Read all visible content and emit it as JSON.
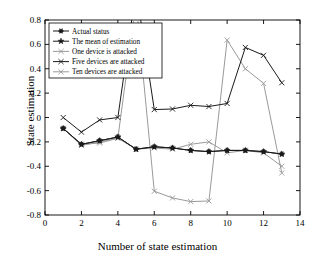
{
  "chart_data": {
    "type": "line",
    "title": "",
    "xlabel": "Number of state estimation",
    "ylabel": "State estimation",
    "xlim": [
      0,
      14
    ],
    "ylim": [
      -0.8,
      0.8
    ],
    "xticks": [
      0,
      2,
      4,
      6,
      8,
      10,
      12,
      14
    ],
    "yticks": [
      -0.8,
      -0.6,
      -0.4,
      -0.2,
      0,
      0.2,
      0.4,
      0.6,
      0.8
    ],
    "xticklabels": [
      "0",
      "2",
      "4",
      "6",
      "8",
      "10",
      "12",
      "14"
    ],
    "yticklabels": [
      "-0.8",
      "-0.6",
      "-0.4",
      "-0.2",
      "0",
      "0.2",
      "0.4",
      "0.6",
      "0.8"
    ],
    "grid": false,
    "legend_position": "upper left",
    "x": [
      1,
      2,
      3,
      4,
      5,
      6,
      7,
      8,
      9,
      10,
      11,
      12,
      13
    ],
    "series": [
      {
        "name": "Actual status",
        "marker": "circle-filled",
        "color": "#1a1a1a",
        "values": [
          -0.09,
          -0.22,
          -0.19,
          -0.16,
          -0.26,
          -0.24,
          -0.25,
          -0.27,
          -0.28,
          -0.27,
          -0.27,
          -0.28,
          -0.3
        ]
      },
      {
        "name": "The mean of estimation",
        "marker": "star",
        "color": "#1a1a1a",
        "values": [
          -0.09,
          -0.22,
          -0.19,
          -0.16,
          -0.26,
          -0.24,
          -0.25,
          -0.27,
          -0.28,
          -0.27,
          -0.27,
          -0.28,
          -0.3
        ]
      },
      {
        "name": "One device is attacked",
        "marker": "x",
        "color": "#9a9a9a",
        "values": [
          -0.09,
          -0.23,
          -0.2,
          -0.17,
          -0.26,
          -0.25,
          -0.26,
          -0.22,
          -0.2,
          -0.29,
          -0.27,
          -0.29,
          -0.4
        ]
      },
      {
        "name": "Five devices are attacked",
        "marker": "x",
        "color": "#1a1a1a",
        "values": [
          0.0,
          -0.12,
          -0.02,
          0.0,
          1.05,
          0.065,
          0.07,
          0.1,
          0.09,
          0.115,
          0.575,
          0.51,
          0.285
        ]
      },
      {
        "name": "Ten devices are attacked",
        "marker": "x",
        "color": "#9a9a9a",
        "values": [
          -0.09,
          -0.22,
          -0.21,
          -0.17,
          0.95,
          -0.605,
          -0.66,
          -0.69,
          -0.685,
          0.635,
          0.4,
          0.28,
          -0.455
        ]
      }
    ]
  },
  "legend": {
    "entries": [
      {
        "label": "Actual status"
      },
      {
        "label": "The mean of estimation"
      },
      {
        "label": "One device is attacked"
      },
      {
        "label": "Five devices are attacked"
      },
      {
        "label": "Ten devices are attacked"
      }
    ]
  },
  "colors": {
    "dark": "#1a1a1a",
    "light": "#9a9a9a",
    "axis": "#000000",
    "background": "#ffffff"
  }
}
